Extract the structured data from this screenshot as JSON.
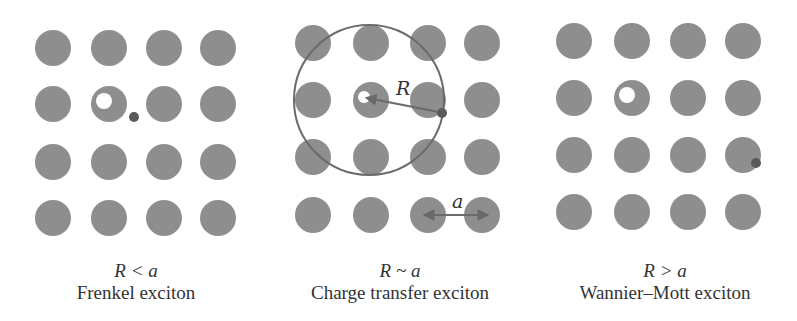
{
  "colors": {
    "atom": "#8e8e8e",
    "hole": "#ffffff",
    "electron": "#5a5a5a",
    "orbit": "#6a6a6a",
    "arrow": "#6a6a6a",
    "text": "#333333"
  },
  "panels": [
    {
      "id": "frenkel",
      "relation": "R < a",
      "name": "Frenkel exciton",
      "grid_x": [
        53,
        109,
        164,
        218
      ],
      "grid_y": [
        48,
        104,
        162,
        218
      ],
      "atom_r": 18,
      "hole": {
        "x": 104,
        "y": 101,
        "r": 8
      },
      "electron": {
        "x": 134,
        "y": 117,
        "r": 5
      },
      "caption_x": 136
    },
    {
      "id": "charge-transfer",
      "relation": "R ~ a",
      "name": "Charge transfer exciton",
      "grid_x": [
        313,
        371,
        428,
        482
      ],
      "grid_y": [
        43,
        100,
        157,
        215
      ],
      "atom_r": 18,
      "hole": {
        "x": 364,
        "y": 97,
        "r": 6
      },
      "electron": {
        "x": 442,
        "y": 113,
        "r": 5
      },
      "orbit": {
        "cx": 369,
        "cy": 100,
        "r": 75
      },
      "radius_label": "R",
      "radius_label_pos": {
        "x": 396,
        "y": 95
      },
      "lattice_label": "a",
      "lattice_label_pos": {
        "x": 452,
        "y": 208
      },
      "lattice_arrow": {
        "x1": 425,
        "x2": 487,
        "y": 215
      },
      "caption_x": 400
    },
    {
      "id": "wannier-mott",
      "relation": "R > a",
      "name": "Wannier–Mott exciton",
      "grid_x": [
        574,
        632,
        688,
        743
      ],
      "grid_y": [
        41,
        98,
        155,
        212
      ],
      "atom_r": 18,
      "hole": {
        "x": 627,
        "y": 95,
        "r": 8
      },
      "electron": {
        "x": 756,
        "y": 163,
        "r": 5
      },
      "caption_x": 665
    }
  ]
}
